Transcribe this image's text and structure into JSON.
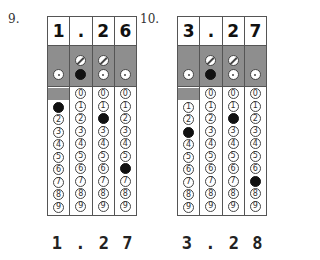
{
  "questions": [
    {
      "number": "9.",
      "entered": [
        "1",
        ".",
        "2",
        "6"
      ],
      "columns": [
        {
          "slash": false,
          "decimal_filled": false,
          "digit_filled": 1,
          "has_zero": false
        },
        {
          "slash": true,
          "decimal_filled": true,
          "digit_filled": null,
          "has_zero": true
        },
        {
          "slash": true,
          "decimal_filled": false,
          "digit_filled": 2,
          "has_zero": true
        },
        {
          "slash": false,
          "decimal_filled": false,
          "digit_filled": 6,
          "has_zero": true
        }
      ],
      "answer_label": [
        "1",
        ".",
        "2",
        "7"
      ]
    },
    {
      "number": "10.",
      "entered": [
        "3",
        ".",
        "2",
        "7"
      ],
      "columns": [
        {
          "slash": false,
          "decimal_filled": false,
          "digit_filled": 3,
          "has_zero": false
        },
        {
          "slash": true,
          "decimal_filled": true,
          "digit_filled": null,
          "has_zero": true
        },
        {
          "slash": true,
          "decimal_filled": false,
          "digit_filled": 2,
          "has_zero": true
        },
        {
          "slash": false,
          "decimal_filled": false,
          "digit_filled": 7,
          "has_zero": true
        }
      ],
      "answer_label": [
        "3",
        ".",
        "2",
        "8"
      ]
    }
  ],
  "digits": [
    "0",
    "1",
    "2",
    "3",
    "4",
    "5",
    "6",
    "7",
    "8",
    "9"
  ],
  "colors": {
    "shade": "#8e8e8e",
    "fill": "#111111",
    "border": "#555555"
  }
}
